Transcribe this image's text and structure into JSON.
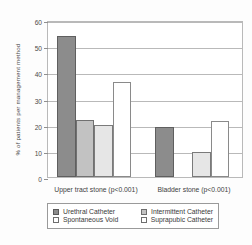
{
  "chart_data": {
    "type": "bar",
    "title": "",
    "xlabel": "",
    "ylabel": "% of patients per management method",
    "ylim": [
      0,
      60
    ],
    "yticks": [
      0,
      10,
      20,
      30,
      40,
      50,
      60
    ],
    "ytick_labels": [
      "0",
      "10",
      "20",
      "30",
      "40",
      "50",
      "60"
    ],
    "grid": true,
    "legend_position": "bottom",
    "categories": [
      "Upper tract stone (p<0.001)",
      "Bladder stone (p<0.001)"
    ],
    "series": [
      {
        "name": "Urethral Catheter",
        "color": "#8c8c8c",
        "values": [
          54,
          19
        ]
      },
      {
        "name": "Intermittent Catheter",
        "color": "#c2c2c2",
        "values": [
          21.7,
          0
        ]
      },
      {
        "name": "Spontaneous Void",
        "color": "#e6e6e6",
        "values": [
          20,
          9.5
        ]
      },
      {
        "name": "Suprapubic Catheter",
        "color": "#ffffff",
        "values": [
          36.5,
          21.5
        ]
      }
    ]
  },
  "legend": {
    "entries": [
      {
        "label": "Urethral Catheter"
      },
      {
        "label": "Intermittent Catheter"
      },
      {
        "label": "Spontaneous Void"
      },
      {
        "label": "Suprapubic Catheter"
      }
    ]
  }
}
